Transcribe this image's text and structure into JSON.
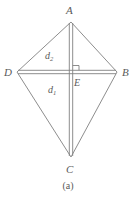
{
  "figure": {
    "name": "kite-diagram",
    "caption": "(a)",
    "stroke_color": "#808080",
    "text_color": "#5a5a5a",
    "background_color": "#ffffff",
    "vertices": [
      {
        "id": "A",
        "label": "A",
        "x": 71,
        "y": 22
      },
      {
        "id": "B",
        "label": "B",
        "x": 117,
        "y": 72
      },
      {
        "id": "C",
        "label": "C",
        "x": 71,
        "y": 157
      },
      {
        "id": "D",
        "label": "D",
        "x": 17,
        "y": 72
      },
      {
        "id": "E",
        "label": "E",
        "x": 71,
        "y": 72
      }
    ],
    "diagonals": [
      {
        "id": "d1",
        "label": "d",
        "subscript": "1",
        "from": "A",
        "to": "C",
        "orientation": "vertical"
      },
      {
        "id": "d2",
        "label": "d",
        "subscript": "2",
        "from": "D",
        "to": "B",
        "orientation": "horizontal"
      }
    ],
    "right_angle_at": "E",
    "shape_type": "kite",
    "sides": [
      "AD",
      "AB",
      "DC",
      "CB"
    ]
  }
}
